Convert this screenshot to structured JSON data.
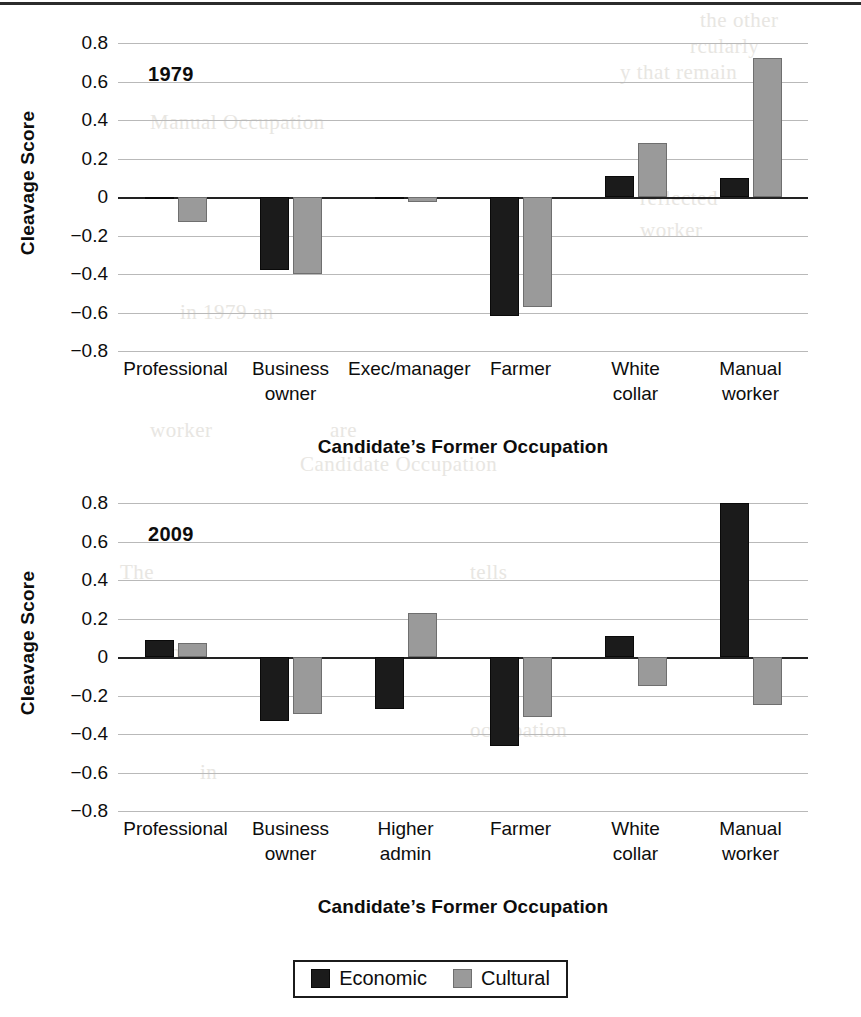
{
  "colors": {
    "economic": "#1b1b1b",
    "cultural": "#9a9a9a",
    "gridline": "#b9b9b9",
    "axis": "#222222"
  },
  "legend": {
    "position": "bottom-center",
    "items": [
      {
        "label": "Economic",
        "swatch": "economic"
      },
      {
        "label": "Cultural",
        "swatch": "cultural"
      }
    ]
  },
  "axis": {
    "ylabel": "Cleavage Score",
    "xlabel": "Candidate’s Former Occupation",
    "ticks": [
      "0.8",
      "0.6",
      "0.4",
      "0.2",
      "0",
      "−0.2",
      "−0.4",
      "−0.6",
      "−0.8"
    ]
  },
  "bleed_text": [
    {
      "text": "the other",
      "x": 700,
      "y": 8
    },
    {
      "text": "rcularly",
      "x": 690,
      "y": 34
    },
    {
      "text": "y that remain",
      "x": 620,
      "y": 60
    },
    {
      "text": "Manual Occupation",
      "x": 150,
      "y": 110
    },
    {
      "text": "reflected",
      "x": 640,
      "y": 186
    },
    {
      "text": "worker",
      "x": 640,
      "y": 218
    },
    {
      "text": "in 1979 an",
      "x": 180,
      "y": 300
    },
    {
      "text": "worker",
      "x": 150,
      "y": 418
    },
    {
      "text": "are",
      "x": 330,
      "y": 418
    },
    {
      "text": "Candidate Occupation",
      "x": 300,
      "y": 452
    },
    {
      "text": "The",
      "x": 120,
      "y": 560
    },
    {
      "text": "tells",
      "x": 470,
      "y": 560
    },
    {
      "text": "mic",
      "x": 170,
      "y": 640
    },
    {
      "text": "occupation",
      "x": 470,
      "y": 718
    },
    {
      "text": "in",
      "x": 200,
      "y": 760
    }
  ],
  "chart_data": [
    {
      "type": "bar",
      "title": "1979",
      "xlabel": "Candidate’s Former Occupation",
      "ylabel": "Cleavage Score",
      "ylim": [
        -0.8,
        0.8
      ],
      "ytick_step": 0.2,
      "grid": true,
      "legend_position": "bottom-center",
      "categories": [
        "Professional",
        "Business owner",
        "Exec/manager",
        "Farmer",
        "White collar",
        "Manual worker"
      ],
      "series": [
        {
          "name": "Economic",
          "values": [
            -0.01,
            -0.38,
            -0.005,
            -0.62,
            0.11,
            0.1
          ]
        },
        {
          "name": "Cultural",
          "values": [
            -0.13,
            -0.4,
            -0.025,
            -0.57,
            0.28,
            0.72
          ]
        }
      ]
    },
    {
      "type": "bar",
      "title": "2009",
      "xlabel": "Candidate’s Former Occupation",
      "ylabel": "Cleavage Score",
      "ylim": [
        -0.8,
        0.8
      ],
      "ytick_step": 0.2,
      "grid": true,
      "legend_position": "bottom-center",
      "categories": [
        "Professional",
        "Business owner",
        "Higher admin",
        "Farmer",
        "White collar",
        "Manual worker"
      ],
      "series": [
        {
          "name": "Economic",
          "values": [
            0.09,
            -0.335,
            -0.27,
            -0.46,
            0.11,
            0.8
          ]
        },
        {
          "name": "Cultural",
          "values": [
            0.075,
            -0.295,
            0.23,
            -0.31,
            -0.15,
            -0.25
          ]
        }
      ]
    }
  ]
}
